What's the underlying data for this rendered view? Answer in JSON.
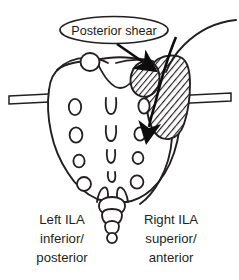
{
  "figure": {
    "name": "sacrum-posterior-shear-diagram",
    "view": "posterior",
    "background_color": "#ffffff",
    "line_color": "#231f20",
    "hatch_color": "#231f20",
    "text_color": "#231f20"
  },
  "callout": {
    "label": "Posterior shear",
    "shape": "ellipse"
  },
  "labels": {
    "left": {
      "line1": "Left ILA",
      "line2": "inferior/",
      "line3": "posterior"
    },
    "right": {
      "line1": "Right ILA",
      "line2": "superior/",
      "line3": "anterior"
    }
  },
  "annotations": {
    "arrow_upper": "shear-direction-arrow-upper",
    "arrow_lower": "shear-direction-arrow-lower",
    "bar_left": "reference-bar-left",
    "bar_right": "reference-bar-right"
  },
  "anatomy": {
    "sacrum": "sacrum-outline",
    "coccyx": "coccyx-outline",
    "ilium": "ilium-hatched-region",
    "sacral_tubercle": "sacral-tubercle-circle",
    "iliac_crest": "iliac-crest-curve",
    "foramina_left_count": 4,
    "foramina_right_count": 4,
    "median_crest_count": 4
  }
}
